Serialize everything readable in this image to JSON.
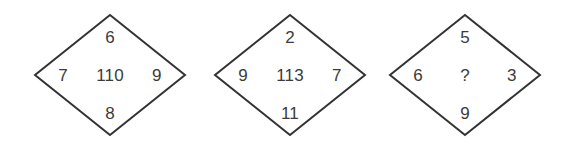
{
  "figure": {
    "kind": "diamond-number-puzzle",
    "background_color": "#ffffff",
    "stroke_color": "#333333",
    "text_color": "#3b3b3b",
    "diamond_count": 3
  },
  "diamonds": [
    {
      "index": 1,
      "top": "6",
      "left": "7",
      "right": "9",
      "bottom": "8",
      "center": "110",
      "center_is_unknown": false
    },
    {
      "index": 2,
      "top": "2",
      "left": "9",
      "right": "7",
      "bottom": "11",
      "center": "113",
      "center_is_unknown": false
    },
    {
      "index": 3,
      "top": "5",
      "left": "6",
      "right": "3",
      "bottom": "9",
      "center": "?",
      "center_is_unknown": true
    }
  ]
}
